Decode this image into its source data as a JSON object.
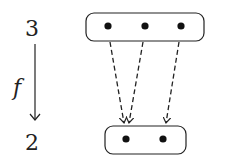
{
  "diagram": {
    "source": {
      "label": "3",
      "points": 3
    },
    "target": {
      "label": "2",
      "points": 2
    },
    "map_label": "f",
    "mappings": [
      {
        "from": 0,
        "to": 0
      },
      {
        "from": 1,
        "to": 0
      },
      {
        "from": 2,
        "to": 1
      }
    ],
    "colors": {
      "stroke": "#222222",
      "background": "#ffffff"
    }
  }
}
